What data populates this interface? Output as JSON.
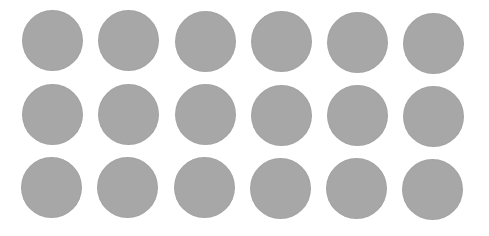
{
  "canvas": {
    "width": 489,
    "height": 236,
    "background": "#ffffff"
  },
  "grid": {
    "rows": 3,
    "columns": 6,
    "dot_color": "#a7a7a7",
    "dot_diameter": 61,
    "column_centers_x": [
      52,
      128,
      205,
      281,
      357,
      433
    ],
    "row_centers_y": [
      40,
      114,
      187
    ],
    "row_x_offsets": [
      0,
      0,
      -1
    ],
    "row_y_drift_per_column": [
      0.6,
      0.4,
      0.4
    ]
  }
}
